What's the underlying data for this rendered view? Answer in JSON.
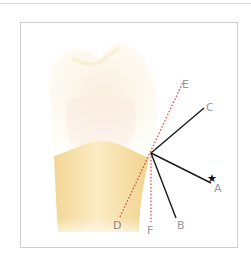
{
  "diagram": {
    "colors": {
      "crown": "#fdf8ec",
      "root": "#f6dfa6",
      "solid_line": "#1a1a1a",
      "dotted_line": "#d9534f",
      "label": "#9a9a9a",
      "frame": "#cfcfcf"
    },
    "vertex": {
      "x": 151,
      "y": 153
    },
    "lines": [
      {
        "id": "A",
        "style": "solid",
        "end": {
          "x": 211,
          "y": 183
        },
        "label": "A",
        "label_pos": {
          "x": 214,
          "y": 192
        },
        "marked": true
      },
      {
        "id": "B",
        "style": "solid",
        "end": {
          "x": 176,
          "y": 218
        },
        "label": "B",
        "label_pos": {
          "x": 177,
          "y": 229
        }
      },
      {
        "id": "C",
        "style": "solid",
        "end": {
          "x": 204,
          "y": 108
        },
        "label": "C",
        "label_pos": {
          "x": 206,
          "y": 111
        }
      },
      {
        "id": "D",
        "style": "dotted",
        "end": {
          "x": 120,
          "y": 217
        },
        "label": "D",
        "label_pos": {
          "x": 113,
          "y": 229
        }
      },
      {
        "id": "E",
        "style": "dotted",
        "end": {
          "x": 184,
          "y": 80
        },
        "label": "E",
        "label_pos": {
          "x": 182,
          "y": 88
        }
      },
      {
        "id": "F",
        "style": "dotted",
        "end": {
          "x": 151,
          "y": 222
        },
        "label": "F",
        "label_pos": {
          "x": 147,
          "y": 234
        }
      }
    ],
    "marker": {
      "symbol": "★",
      "target": "A",
      "pos": {
        "x": 208,
        "y": 182
      }
    },
    "labels": {
      "A": "A",
      "B": "B",
      "C": "C",
      "D": "D",
      "E": "E",
      "F": "F",
      "star": "★"
    }
  }
}
